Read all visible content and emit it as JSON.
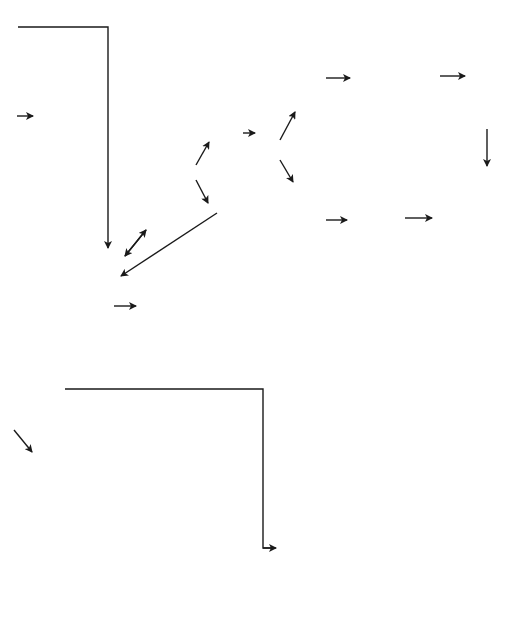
{
  "diagram": {
    "type": "flowchart",
    "orientation": "rotated-90-ccw",
    "nodes": {
      "baby_should_thrive": "Baby should\nthrive",
      "remind_mum": "Remind mum of\nimportance of\nthis – baby\nshould thrive",
      "health_visitor_monitor": "Health visitor will\nmonitor weight\nmore frequently\n(alternate days or\ntwice weekly)",
      "if_inadequate": "If inadequate\nweight gain,\ninvestigate",
      "if_on_demand": "If baby feeding\non demand?",
      "yes_demand": "Yes",
      "no_demand": "No",
      "is_baby_fed": "Is baby fed . . .",
      "too_frequently_top": "Too frequently",
      "too_infrequently_top": "Too infrequently",
      "if_offered_two_hourly": "If baby is offered\nfeeds more than\ntwo-hourly, he or\nshe may just by\nsnacking",
      "offer_less_top": "Offer feeds less\nfrequently",
      "offer_more_top": "Offer feeds more\noften – baby\nshould thrive",
      "still_not_thrive_top": "Baby still does\nnot thrive? This\nbaby needs\ninvestigation",
      "no_main": "No",
      "yes_main": "Yes",
      "is_sufficient": "Is sufficient feed\nbeing offered?",
      "no_sufficient": "No",
      "yes_sufficient": "Yes",
      "increase_formula": "Increase amount\nof formula given\neach feed – baby\nshould thrive",
      "how_often": "How often are\nthe feeds\noffered?",
      "too_infrequently_bottom": "Too infrequently",
      "too_frequently_bottom": "Too frequently –\nif feeds offered\nmore than two\nhourly, baby may\nonly be snacking",
      "offer_more_bottom": "Offer feeds more\noften – baby\nshould thrive",
      "offer_less_bottom": "Offer feeds less\nfrequently, but\nincrease amount\noffered – baby\nshould thrive",
      "still_not_thrive_bottom": "Baby still does\nnot thrive? Does\nthe feed suit the\nbaby? Health visi-\ntor will advise"
    }
  }
}
